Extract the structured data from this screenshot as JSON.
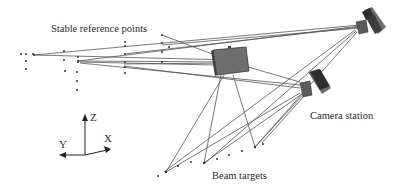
{
  "labels": {
    "stable_reference_points": "Stable reference points",
    "camera_station": "Camera station",
    "beam_targets": "Beam targets"
  },
  "axes": {
    "x_label": "X",
    "y_label": "Y",
    "z_label": "Z"
  },
  "colors": {
    "line": "#555555",
    "dot": "#333333",
    "camera_body": "#6e6e6e",
    "camera_dark": "#2e2e2e",
    "text": "#2a2a2a"
  },
  "components": {
    "reference_point_count": 26,
    "beam_target_count": 10,
    "camera_count": 3
  }
}
